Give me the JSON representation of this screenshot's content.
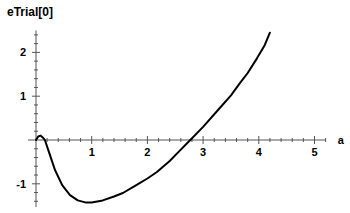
{
  "chart_data": {
    "type": "line",
    "title": "eTrial[0]",
    "xlabel": "a",
    "ylabel": "eTrial[0]",
    "xlim": [
      0,
      5.2
    ],
    "ylim": [
      -1.5,
      2.5
    ],
    "x_ticks": [
      1,
      2,
      3,
      4,
      5
    ],
    "y_ticks": [
      -1,
      1,
      2
    ],
    "grid": false,
    "legend": null,
    "series": [
      {
        "name": "eTrial[0]",
        "color": "#000000",
        "x": [
          0.0,
          0.04,
          0.08,
          0.12,
          0.16,
          0.25,
          0.34,
          0.47,
          0.61,
          0.75,
          0.9,
          1.0,
          1.2,
          1.4,
          1.56,
          1.8,
          2.0,
          2.17,
          2.4,
          2.59,
          2.77,
          3.0,
          3.3,
          3.5,
          3.66,
          3.8,
          3.97,
          4.1,
          4.2
        ],
        "y": [
          0.0,
          0.08,
          0.1,
          0.06,
          0.0,
          -0.34,
          -0.68,
          -1.03,
          -1.26,
          -1.38,
          -1.43,
          -1.43,
          -1.38,
          -1.29,
          -1.21,
          -1.03,
          -0.88,
          -0.73,
          -0.48,
          -0.23,
          0.0,
          0.3,
          0.73,
          1.02,
          1.3,
          1.53,
          1.87,
          2.15,
          2.45
        ]
      }
    ]
  },
  "header": {
    "title": "eTrial[0]"
  },
  "axes": {
    "x_label": "a",
    "x_tick_labels": [
      "1",
      "2",
      "3",
      "4",
      "5"
    ],
    "y_tick_labels": [
      "-1",
      "1",
      "2"
    ]
  }
}
